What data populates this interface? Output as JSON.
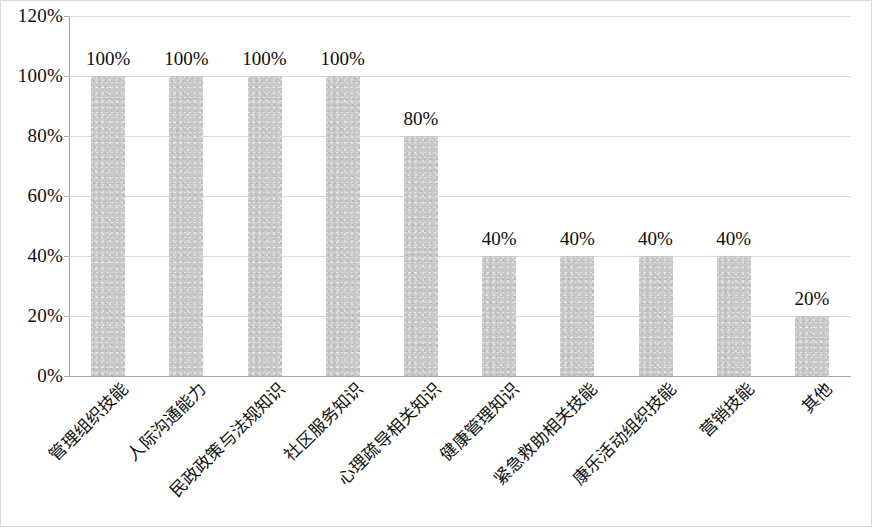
{
  "chart_data": {
    "type": "bar",
    "title": "",
    "subtitle": "",
    "xlabel": "",
    "ylabel": "",
    "categories": [
      "管理组织技能",
      "人际沟通能力",
      "民政政策与法规知识",
      "社区服务知识",
      "心理疏导相关知识",
      "健康管理知识",
      "紧急救助相关技能",
      "康乐活动组织技能",
      "营销技能",
      "其他"
    ],
    "values": [
      100,
      100,
      100,
      100,
      80,
      40,
      40,
      40,
      40,
      20
    ],
    "value_labels": [
      "100%",
      "100%",
      "100%",
      "100%",
      "80%",
      "40%",
      "40%",
      "40%",
      "40%",
      "20%"
    ],
    "ylim": [
      0,
      120
    ],
    "ytick_values": [
      0,
      20,
      40,
      60,
      80,
      100,
      120
    ],
    "ytick_labels": [
      "0%",
      "20%",
      "40%",
      "60%",
      "80%",
      "100%",
      "120%"
    ],
    "grid": true,
    "legend": false,
    "legend_position": "none",
    "bar_color": "#c9c9c9",
    "gridline_color": "#d6dce4",
    "axis_color": "#a6a6a6",
    "text_color": "#0d0d0d",
    "x_label_rotation": -45
  }
}
